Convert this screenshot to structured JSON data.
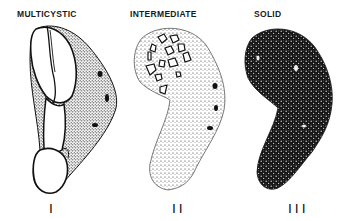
{
  "figure": {
    "panels": [
      {
        "label": "MULTICYSTIC",
        "numeral": "I"
      },
      {
        "label": "INTERMEDIATE",
        "numeral": "II"
      },
      {
        "label": "SOLID",
        "numeral": "III"
      }
    ]
  },
  "colors": {
    "ink": "#111111",
    "background": "#ffffff"
  }
}
